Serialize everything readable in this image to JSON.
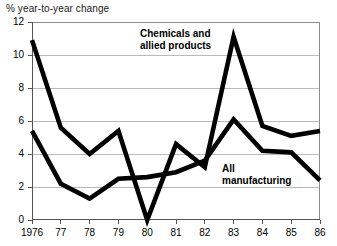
{
  "chart_data": {
    "type": "line",
    "title": "",
    "ylabel": "% year-to-year change",
    "xlabel": "",
    "ylim": [
      0,
      12
    ],
    "yticks": [
      0,
      2,
      4,
      6,
      8,
      10,
      12
    ],
    "grid": true,
    "legend_position": "inline-annotations",
    "categories": [
      "1976",
      "77",
      "78",
      "79",
      "80",
      "81",
      "82",
      "83",
      "84",
      "85",
      "86"
    ],
    "x": [
      1976,
      1977,
      1978,
      1979,
      1980,
      1981,
      1982,
      1983,
      1984,
      1985,
      1986
    ],
    "series": [
      {
        "name": "Chemicals and allied products",
        "values": [
          10.9,
          5.6,
          4.0,
          5.4,
          0.0,
          4.6,
          3.2,
          11.1,
          5.7,
          5.1,
          5.4
        ]
      },
      {
        "name": "All manufacturing",
        "values": [
          5.4,
          2.2,
          1.3,
          2.5,
          2.6,
          2.9,
          3.6,
          6.1,
          4.2,
          4.1,
          2.4
        ]
      }
    ],
    "annotations": [
      {
        "id": "chemicals",
        "line1": "Chemicals and",
        "line2": "allied products"
      },
      {
        "id": "all-manufacturing",
        "line1": "All",
        "line2": "manufacturing"
      }
    ],
    "colors": {
      "series_line": "#000000",
      "grid": "#b9b9b9",
      "frame": "#8c8c8c",
      "background": "#ffffff",
      "text": "#000000"
    }
  },
  "ytick_labels": [
    "12",
    "10",
    "8",
    "6",
    "4",
    "2",
    "0"
  ],
  "xtick_labels": [
    "1976",
    "77",
    "78",
    "79",
    "80",
    "81",
    "82",
    "83",
    "84",
    "85",
    "86"
  ],
  "axis": {
    "y_caption": "% year-to-year change"
  },
  "annotation_chemicals": {
    "line1": "Chemicals and",
    "line2": "allied products"
  },
  "annotation_allmfg": {
    "line1": "All",
    "line2": "manufacturing"
  }
}
